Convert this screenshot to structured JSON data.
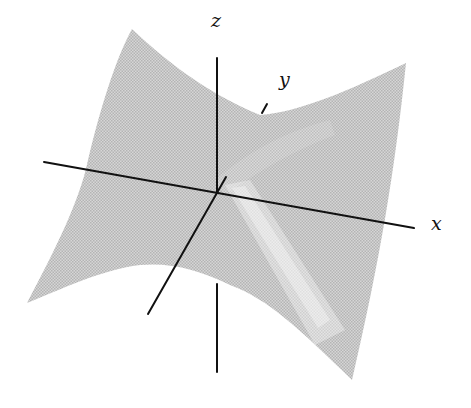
{
  "figure": {
    "surface_color": "#c8c8c8",
    "highlight_color": "#f2f2f2",
    "axis_color": "#111111",
    "axes": {
      "x": {
        "label": "x"
      },
      "y": {
        "label": "y"
      },
      "z": {
        "label": "z"
      }
    }
  }
}
